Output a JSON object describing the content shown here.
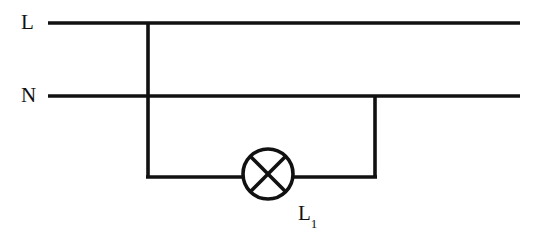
{
  "diagram": {
    "type": "electrical-circuit-schematic",
    "background_color": "#ffffff",
    "line_color": "#111111",
    "line_width": 3.5,
    "labels": {
      "live_rail": "L",
      "neutral_rail": "N",
      "lamp": "L",
      "lamp_subscript": "1",
      "lamp_full": "L1"
    },
    "components": [
      {
        "name": "live-rail",
        "kind": "wire",
        "orientation": "horizontal",
        "label": "L",
        "x1": 48,
        "y1": 23,
        "x2": 520,
        "y2": 23
      },
      {
        "name": "neutral-rail",
        "kind": "wire",
        "orientation": "horizontal",
        "label": "N",
        "x1": 48,
        "y1": 96,
        "x2": 520,
        "y2": 96
      },
      {
        "name": "left-branch-wire",
        "kind": "wire",
        "orientation": "vertical",
        "x1": 148,
        "y1": 23,
        "x2": 148,
        "y2": 177
      },
      {
        "name": "right-branch-wire",
        "kind": "wire",
        "orientation": "vertical",
        "x1": 375,
        "y1": 96,
        "x2": 375,
        "y2": 177
      },
      {
        "name": "bottom-wire-left",
        "kind": "wire",
        "orientation": "horizontal",
        "x1": 148,
        "y1": 177,
        "x2": 243,
        "y2": 177
      },
      {
        "name": "bottom-wire-right",
        "kind": "wire",
        "orientation": "horizontal",
        "x1": 293,
        "y1": 177,
        "x2": 375,
        "y2": 177
      },
      {
        "name": "lamp-symbol",
        "kind": "lamp",
        "label": "L1",
        "cx": 268,
        "cy": 174,
        "r": 25
      }
    ],
    "junctions": [
      {
        "name": "live-rail-junction",
        "x": 148,
        "y": 23
      },
      {
        "name": "neutral-rail-junction",
        "x": 375,
        "y": 96
      },
      {
        "name": "left-wire-crossing-neutral",
        "x": 148,
        "y": 96,
        "connected": false
      }
    ]
  }
}
